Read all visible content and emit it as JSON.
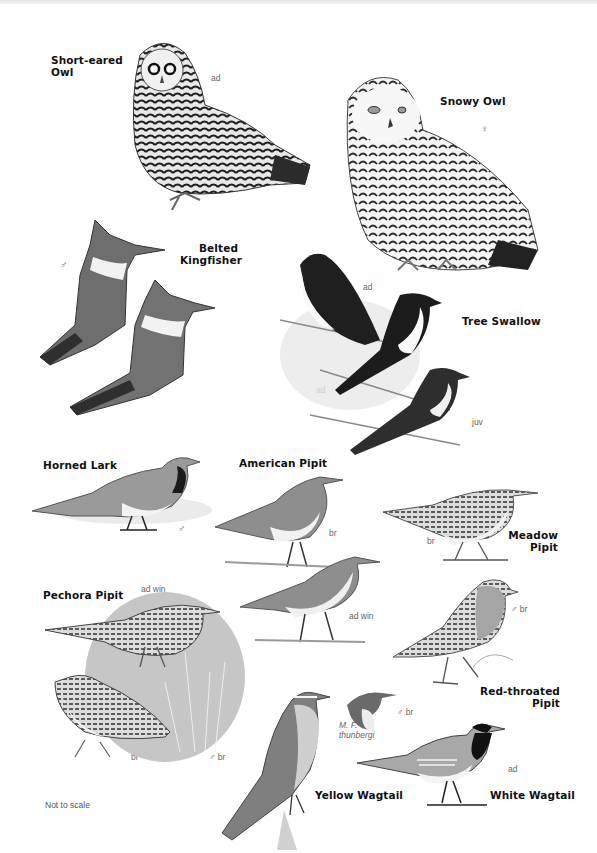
{
  "plate": {
    "species": [
      {
        "name": "Short-eared Owl",
        "lines": [
          "Short-eared",
          "Owl"
        ],
        "tags": [
          "ad"
        ]
      },
      {
        "name": "Snowy Owl",
        "lines": [
          "Snowy Owl"
        ],
        "tags": [
          "♀"
        ]
      },
      {
        "name": "Belted Kingfisher",
        "lines": [
          "Belted",
          "Kingfisher"
        ],
        "tags": [
          "♂",
          "♀"
        ]
      },
      {
        "name": "Tree Swallow",
        "lines": [
          "Tree Swallow"
        ],
        "tags": [
          "ad",
          "ad",
          "juv"
        ]
      },
      {
        "name": "Horned Lark",
        "lines": [
          "Horned Lark"
        ],
        "tags": [
          "♂"
        ]
      },
      {
        "name": "American Pipit",
        "lines": [
          "American Pipit"
        ],
        "tags": [
          "br",
          "ad win"
        ]
      },
      {
        "name": "Meadow Pipit",
        "lines": [
          "Meadow",
          "Pipit"
        ],
        "tags": [
          "br"
        ]
      },
      {
        "name": "Pechora Pipit",
        "lines": [
          "Pechora Pipit"
        ],
        "tags": [
          "ad win",
          "br"
        ]
      },
      {
        "name": "Red-throated Pipit",
        "lines": [
          "Red-throated",
          "Pipit"
        ],
        "tags": [
          "♂ br"
        ]
      },
      {
        "name": "Yellow Wagtail",
        "lines": [
          "Yellow Wagtail"
        ],
        "tags": [
          "♂ br",
          "M. F.",
          "thunbergi",
          "♂ br"
        ]
      },
      {
        "name": "White Wagtail",
        "lines": [
          "White Wagtail"
        ],
        "tags": [
          "ad"
        ]
      }
    ],
    "footnote": "Not to scale"
  },
  "colors": {
    "background": "#ffffff",
    "label_text": "#111111",
    "tag_text": "#666666",
    "bird_dark": "#2a2a2a",
    "bird_mid": "#7a7a7a",
    "bird_light": "#d6d6d6"
  }
}
